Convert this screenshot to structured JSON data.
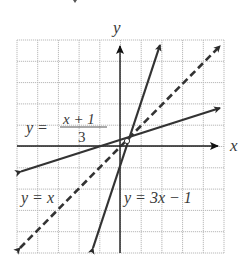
{
  "chart_data": {
    "type": "line",
    "title": "",
    "xlabel": "x",
    "ylabel": "y",
    "xlim": [
      -5,
      5
    ],
    "ylim": [
      -5,
      5
    ],
    "grid": true,
    "legend_position": "inline labels",
    "series": [
      {
        "name": "y = 3x − 1",
        "style": "solid",
        "points": [
          [
            -1.35,
            -5
          ],
          [
            2.0,
            5
          ]
        ],
        "label_position": "lower-right"
      },
      {
        "name": "y = (x + 1)/3",
        "style": "solid",
        "points": [
          [
            -4.9,
            -1.3
          ],
          [
            4.9,
            1.9
          ]
        ],
        "label_position": "left-middle"
      },
      {
        "name": "y = x",
        "style": "dashed",
        "points": [
          [
            -4.9,
            -5
          ],
          [
            4.9,
            4.9
          ]
        ],
        "label_position": "lower-left"
      }
    ],
    "intersection": [
      0.5,
      0.5
    ],
    "annotations": [
      "y = (x + 1)/3",
      "y = x",
      "y = 3x − 1"
    ]
  },
  "labels": {
    "x_axis": "x",
    "y_axis": "y",
    "eq_fraction_lhs": "y =",
    "eq_fraction_num": "x + 1",
    "eq_fraction_den": "3",
    "eq_identity": "y = x",
    "eq_steep": "y = 3x − 1"
  },
  "colors": {
    "grid": "#b5b5b5",
    "axis": "#222222",
    "lines": "#3a3a3a",
    "text": "#3a3a3a"
  }
}
